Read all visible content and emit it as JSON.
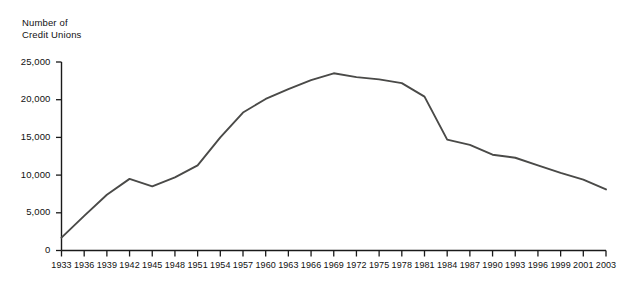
{
  "chart_data": {
    "type": "line",
    "title": "",
    "ylabel": "Number of\nCredit Unions",
    "xlabel": "",
    "ylim": [
      0,
      25000
    ],
    "grid": false,
    "legend": null,
    "y_ticks": [
      0,
      5000,
      10000,
      15000,
      20000,
      25000
    ],
    "y_tick_labels": [
      "0",
      "5,000",
      "10,000",
      "15,000",
      "20,000",
      "25,000"
    ],
    "x_tick_labels": [
      "1933",
      "1936",
      "1939",
      "1942",
      "1945",
      "1948",
      "1951",
      "1954",
      "1957",
      "1960",
      "1963",
      "1966",
      "1969",
      "1972",
      "1975",
      "1978",
      "1981",
      "1984",
      "1987",
      "1990",
      "1993",
      "1996",
      "1999",
      "2001",
      "2003"
    ],
    "categories": [
      1933,
      1936,
      1939,
      1942,
      1945,
      1948,
      1951,
      1954,
      1957,
      1960,
      1963,
      1966,
      1969,
      1972,
      1975,
      1978,
      1981,
      1984,
      1987,
      1990,
      1993,
      1996,
      1999,
      2001,
      2003
    ],
    "values": [
      1700,
      4600,
      7400,
      9500,
      8500,
      9700,
      11300,
      15000,
      18300,
      20100,
      21400,
      22600,
      23500,
      23000,
      22700,
      22200,
      20400,
      14700,
      14000,
      12700,
      12300,
      11300,
      10300,
      9400,
      8100
    ],
    "series": [
      {
        "name": "Number of Credit Unions",
        "color": "#4a4a48",
        "values": [
          1700,
          4600,
          7400,
          9500,
          8500,
          9700,
          11300,
          15000,
          18300,
          20100,
          21400,
          22600,
          23500,
          23000,
          22700,
          22200,
          20400,
          14700,
          14000,
          12700,
          12300,
          11300,
          10300,
          9400,
          8100
        ]
      }
    ],
    "annotations": []
  },
  "axes": {
    "axis_color": "#1a1a1a",
    "line_color": "#4a4a48",
    "tick_direction": "outward"
  }
}
